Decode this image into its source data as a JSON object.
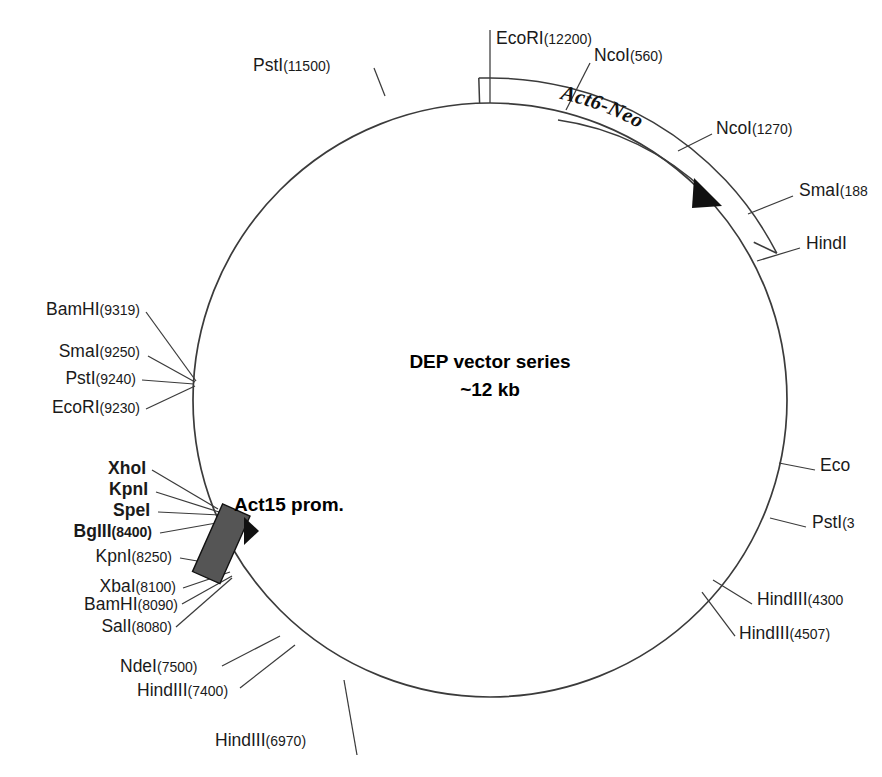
{
  "figure": {
    "kind": "plasmid-map",
    "center_title_line1": "DEP vector series",
    "center_title_line2": "~12 kb",
    "background_color": "#ffffff",
    "line_color": "#3b3b3b",
    "promoter_fill": "#555555"
  },
  "features": [
    {
      "name": "Act6-Neo",
      "style": "bold-italic-serif-on-arc",
      "direction": "clockwise"
    },
    {
      "name": "Act15 prom.",
      "style": "bold-sans",
      "shape": "filled-box-with-arrowhead"
    }
  ],
  "sites": [
    {
      "enzyme": "PstI",
      "position": "(11500)",
      "bold": false,
      "truncated": false
    },
    {
      "enzyme": "EcoRI",
      "position": "(12200)",
      "bold": false,
      "truncated": false
    },
    {
      "enzyme": "NcoI",
      "position": "(560)",
      "bold": false,
      "truncated": false
    },
    {
      "enzyme": "NcoI",
      "position": "(1270)",
      "bold": false,
      "truncated": false
    },
    {
      "enzyme": "SmaI",
      "position": "(188",
      "bold": false,
      "truncated": true
    },
    {
      "enzyme": "HindI",
      "position": "",
      "bold": false,
      "truncated": true
    },
    {
      "enzyme": "Eco",
      "position": "",
      "bold": false,
      "truncated": true
    },
    {
      "enzyme": "PstI",
      "position": "(3",
      "bold": false,
      "truncated": true
    },
    {
      "enzyme": "HindIII",
      "position": "(4300",
      "bold": false,
      "truncated": true
    },
    {
      "enzyme": "HindIII",
      "position": "(4507)",
      "bold": false,
      "truncated": false
    },
    {
      "enzyme": "HindIII",
      "position": "(6970)",
      "bold": false,
      "truncated": false
    },
    {
      "enzyme": "HindIII",
      "position": "(7400)",
      "bold": false,
      "truncated": false
    },
    {
      "enzyme": "NdeI",
      "position": "(7500)",
      "bold": false,
      "truncated": false
    },
    {
      "enzyme": "SalI",
      "position": "(8080)",
      "bold": false,
      "truncated": false
    },
    {
      "enzyme": "BamHI",
      "position": "(8090)",
      "bold": false,
      "truncated": false
    },
    {
      "enzyme": "XbaI",
      "position": "(8100)",
      "bold": false,
      "truncated": false
    },
    {
      "enzyme": "KpnI",
      "position": "(8250)",
      "bold": false,
      "truncated": false
    },
    {
      "enzyme": "BglII",
      "position": "(8400)",
      "bold": true,
      "truncated": false
    },
    {
      "enzyme": "SpeI",
      "position": "",
      "bold": true,
      "truncated": false
    },
    {
      "enzyme": "KpnI",
      "position": "",
      "bold": true,
      "truncated": false
    },
    {
      "enzyme": "XhoI",
      "position": "",
      "bold": true,
      "truncated": false
    },
    {
      "enzyme": "EcoRI",
      "position": "(9230)",
      "bold": false,
      "truncated": false
    },
    {
      "enzyme": "PstI",
      "position": "(9240)",
      "bold": false,
      "truncated": false
    },
    {
      "enzyme": "SmaI",
      "position": "(9250)",
      "bold": false,
      "truncated": false
    },
    {
      "enzyme": "BamHI",
      "position": "(9319)",
      "bold": false,
      "truncated": false
    }
  ]
}
